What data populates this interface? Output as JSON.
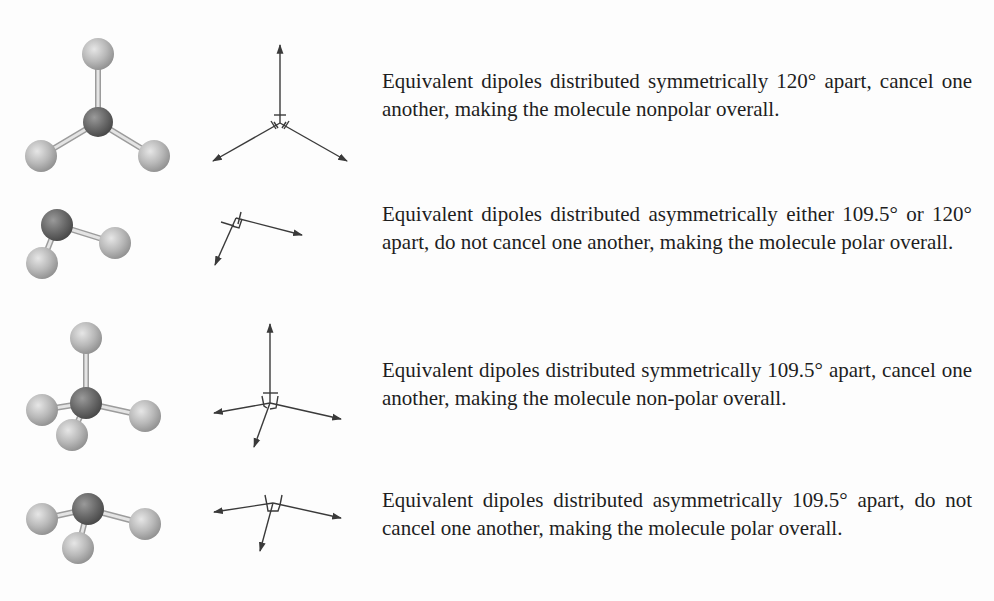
{
  "figure": {
    "rows": [
      {
        "geometry": "trigonal planar",
        "vector_diagram": "three dipoles 120 degrees apart",
        "description": "Equivalent dipoles distributed symmetrically 120° apart, cancel one another, making the molecule nonpolar overall."
      },
      {
        "geometry": "bent",
        "vector_diagram": "two dipoles at an angle",
        "description": "Equivalent dipoles distributed asymmetrically either 109.5° or 120° apart, do not cancel one another, making the molecule polar overall."
      },
      {
        "geometry": "tetrahedral",
        "vector_diagram": "four dipoles 109.5 degrees apart",
        "description": "Equivalent dipoles distributed symmetrically 109.5° apart, cancel one another, making the molecule non-polar overall."
      },
      {
        "geometry": "trigonal pyramidal",
        "vector_diagram": "three dipoles 109.5 degrees apart",
        "description": "Equivalent dipoles distributed asymmetrically 109.5° apart, do not cancel one another, making the molecule polar overall."
      }
    ],
    "colors": {
      "outer_atom": "#b8b8b8",
      "central_atom": "#6e6e6e",
      "bond": "#c8c8c8",
      "arrow": "#3a3a3a",
      "text": "#1e1e1e"
    }
  }
}
